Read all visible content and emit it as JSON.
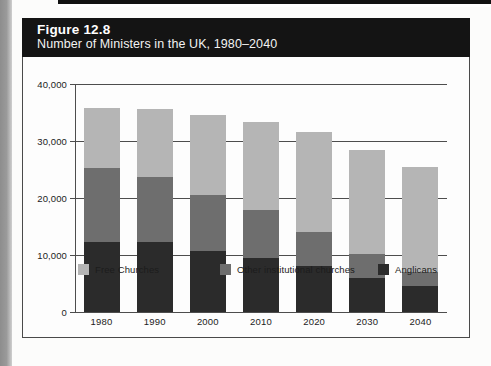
{
  "figure": {
    "number": "Figure 12.8",
    "subtitle": "Number of Ministers in the UK, 1980–2040"
  },
  "colors": {
    "free_churches": "#b5b5b5",
    "other_institutional": "#6e6e6e",
    "anglicans": "#2b2b2b",
    "header_background": "#141414",
    "frame_border": "#4a4a4a",
    "gridline": "#4d4d4d",
    "text": "#1c1c1c"
  },
  "chart_data": {
    "type": "bar",
    "stacked": true,
    "title": "Number of Ministers in the UK, 1980–2040",
    "xlabel": "",
    "ylabel": "",
    "ylim": [
      0,
      40000
    ],
    "yticks": [
      0,
      10000,
      20000,
      30000,
      40000
    ],
    "ytick_labels": [
      "0",
      "10,000",
      "20,000",
      "30,000",
      "40,000"
    ],
    "grid": true,
    "legend_position": "bottom",
    "categories": [
      "1980",
      "1990",
      "2000",
      "2010",
      "2020",
      "2030",
      "2040"
    ],
    "series": [
      {
        "name": "Anglicans",
        "color": "#2b2b2b",
        "values": [
          12300,
          12300,
          10700,
          9400,
          8000,
          6000,
          4500
        ]
      },
      {
        "name": "Other institutional churches",
        "color": "#6e6e6e",
        "values": [
          12900,
          11400,
          9800,
          8500,
          6000,
          4200,
          2500
        ]
      },
      {
        "name": "Free Churches",
        "color": "#b5b5b5",
        "values": [
          10600,
          11900,
          14000,
          15500,
          17500,
          18300,
          18500
        ]
      }
    ],
    "totals": [
      35800,
      35600,
      34500,
      33400,
      31500,
      28500,
      25500
    ]
  },
  "legend": {
    "items": [
      {
        "label": "Free Churches",
        "color": "#b5b5b5"
      },
      {
        "label": "Other institutional churches",
        "color": "#6e6e6e"
      },
      {
        "label": "Anglicans",
        "color": "#2b2b2b"
      }
    ]
  }
}
